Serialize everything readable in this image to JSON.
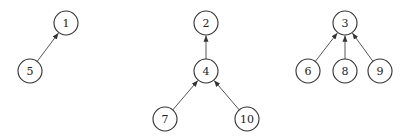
{
  "diagram": {
    "type": "forest",
    "node_radius": 12,
    "nodes": [
      {
        "id": "1",
        "label": "1",
        "x": 66,
        "y": 23
      },
      {
        "id": "5",
        "label": "5",
        "x": 30,
        "y": 71
      },
      {
        "id": "2",
        "label": "2",
        "x": 206,
        "y": 23
      },
      {
        "id": "4",
        "label": "4",
        "x": 206,
        "y": 71
      },
      {
        "id": "7",
        "label": "7",
        "x": 165,
        "y": 119
      },
      {
        "id": "10",
        "label": "10",
        "x": 247,
        "y": 119
      },
      {
        "id": "3",
        "label": "3",
        "x": 345,
        "y": 23
      },
      {
        "id": "6",
        "label": "6",
        "x": 308,
        "y": 71
      },
      {
        "id": "8",
        "label": "8",
        "x": 345,
        "y": 71
      },
      {
        "id": "9",
        "label": "9",
        "x": 380,
        "y": 71
      }
    ],
    "edges": [
      {
        "from": "5",
        "to": "1"
      },
      {
        "from": "4",
        "to": "2"
      },
      {
        "from": "7",
        "to": "4"
      },
      {
        "from": "10",
        "to": "4"
      },
      {
        "from": "6",
        "to": "3"
      },
      {
        "from": "8",
        "to": "3"
      },
      {
        "from": "9",
        "to": "3"
      }
    ],
    "colors": {
      "stroke": "#333333",
      "fill": "#ffffff",
      "text": "#222222"
    }
  }
}
